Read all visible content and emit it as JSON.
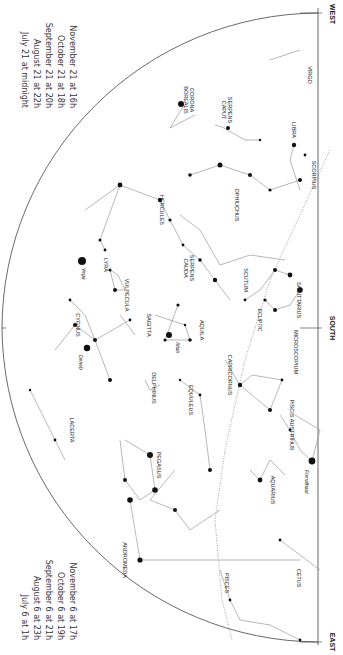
{
  "chart_title_orientation": "rotated 90deg clockwise",
  "horizon": {
    "left_label": "EAST",
    "right_label": "WEST",
    "center_label": "SOUTH",
    "zenith_label": "ZENITH"
  },
  "times_top": [
    {
      "date": "July 21 at midnight",
      "hour": ""
    },
    {
      "date": "August 21 at",
      "hour": "22h"
    },
    {
      "date": "September 21 at",
      "hour": "20h"
    },
    {
      "date": "October 21 at",
      "hour": "18h"
    },
    {
      "date": "November 21 at",
      "hour": "16h"
    }
  ],
  "times_bottom": [
    {
      "date": "July 6 at",
      "hour": "1h"
    },
    {
      "date": "August 6 at",
      "hour": "23h"
    },
    {
      "date": "September 6 at",
      "hour": "21h"
    },
    {
      "date": "October 6 at",
      "hour": "19h"
    },
    {
      "date": "November 6 at",
      "hour": "17h"
    }
  ],
  "constellations": [
    {
      "name": "VIRGO",
      "x": 308,
      "y": 75
    },
    {
      "name": "CORONA BOREALIS",
      "x": 190,
      "y": 100
    },
    {
      "name": "SERPENS CAPUT",
      "x": 228,
      "y": 110
    },
    {
      "name": "LIBRA",
      "x": 292,
      "y": 130
    },
    {
      "name": "HERCULES",
      "x": 160,
      "y": 210
    },
    {
      "name": "OPHIUCHUS",
      "x": 235,
      "y": 205
    },
    {
      "name": "SCORPIUS",
      "x": 312,
      "y": 175
    },
    {
      "name": "LYRA",
      "x": 104,
      "y": 265
    },
    {
      "name": "SERPENS CAUDA",
      "x": 190,
      "y": 268
    },
    {
      "name": "SCUTUM",
      "x": 244,
      "y": 280
    },
    {
      "name": "VULPECULA",
      "x": 125,
      "y": 295
    },
    {
      "name": "SAGITTARIUS",
      "x": 297,
      "y": 300
    },
    {
      "name": "CYGNUS",
      "x": 76,
      "y": 325
    },
    {
      "name": "SAGITTA",
      "x": 147,
      "y": 325
    },
    {
      "name": "AQUILA",
      "x": 200,
      "y": 330
    },
    {
      "name": "ECLIPTIC",
      "x": 258,
      "y": 320
    },
    {
      "name": "MICROSCOPIUM",
      "x": 294,
      "y": 352
    },
    {
      "name": "DELPHINUS",
      "x": 152,
      "y": 388
    },
    {
      "name": "CAPRICORNUS",
      "x": 228,
      "y": 375
    },
    {
      "name": "EQUULEUS",
      "x": 189,
      "y": 400
    },
    {
      "name": "LACERTA",
      "x": 70,
      "y": 430
    },
    {
      "name": "PISCIS AUSTRINUS",
      "x": 290,
      "y": 425
    },
    {
      "name": "PEGASUS",
      "x": 157,
      "y": 465
    },
    {
      "name": "AQUARIUS",
      "x": 271,
      "y": 490
    },
    {
      "name": "ANDROMEDA",
      "x": 123,
      "y": 560
    },
    {
      "name": "PISCES",
      "x": 225,
      "y": 583
    },
    {
      "name": "CETUS",
      "x": 297,
      "y": 578
    }
  ],
  "stars": [
    {
      "name": "Vega",
      "x": 82,
      "y": 261
    },
    {
      "name": "Deneb",
      "x": 87,
      "y": 348
    },
    {
      "name": "Altair",
      "x": 169,
      "y": 335
    },
    {
      "name": "Fomalhaut",
      "x": 312,
      "y": 461
    }
  ],
  "ecliptic_marks": [
    "240°",
    "250°",
    "260°",
    "270°",
    "280°",
    "290°",
    "300°",
    "310°",
    "320°",
    "330°",
    "340°",
    "350°",
    "0°",
    "10°",
    "20°"
  ],
  "colors": {
    "ink": "#222222",
    "line": "#9a9a9a",
    "background": "#ffffff"
  }
}
